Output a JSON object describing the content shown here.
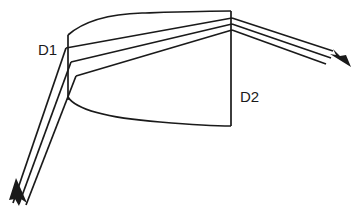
{
  "figure": {
    "background_color": "#ffffff",
    "line_color": "#1a1a1a",
    "width": 363,
    "height": 214
  },
  "labels": [
    {
      "id": "d1",
      "text": "D1",
      "x": 38,
      "y": 55,
      "describes": "input-aperture-diameter"
    },
    {
      "id": "d2",
      "text": "D2",
      "x": 240,
      "y": 102,
      "describes": "output-aperture-diameter"
    }
  ],
  "apertures": [
    {
      "id": "d1-aperture-line",
      "name": "input-aperture",
      "x1": 68,
      "y1": 35,
      "x2": 68,
      "y2": 100
    },
    {
      "id": "d2-aperture-line",
      "name": "output-aperture",
      "x1": 231,
      "y1": 11,
      "x2": 231,
      "y2": 126
    }
  ],
  "envelope": {
    "top_curve": "M 68 35 C 84 21, 108 14, 142 13 C 176 12, 208 11, 231 11",
    "bottom_curve": "M 68 97 C 76 110, 110 118, 160 122 C 196 125, 218 126, 231 126"
  },
  "rays": {
    "incoming": [
      {
        "id": "in-ray-1",
        "d": "M 13 203 L 66 48"
      },
      {
        "id": "in-ray-2",
        "d": "M 19 204 L 71 62"
      },
      {
        "id": "in-ray-3",
        "d": "M 26 205 L 76 76"
      }
    ],
    "internal": [
      {
        "id": "mid-ray-1",
        "d": "M 66 48 L 232 18"
      },
      {
        "id": "mid-ray-2",
        "d": "M 71 62 L 232 24"
      },
      {
        "id": "mid-ray-3",
        "d": "M 76 76 L 232 30"
      }
    ],
    "outgoing": [
      {
        "id": "out-ray-1",
        "d": "M 232 18 L 333 51"
      },
      {
        "id": "out-ray-2",
        "d": "M 232 24 L 331 58"
      },
      {
        "id": "out-ray-3",
        "d": "M 232 30 L 326 64"
      }
    ]
  },
  "arrows": [
    {
      "id": "input-arrowhead",
      "name": "incoming-beam-arrow",
      "direction": "up-left",
      "points": "16,178 27,203 21,199 19,206 15,199 9,200"
    },
    {
      "id": "output-arrowhead",
      "name": "outgoing-beam-arrow",
      "direction": "down-right",
      "points": "351,67 330,54 336,55 333,49 340,56 346,55"
    }
  ]
}
